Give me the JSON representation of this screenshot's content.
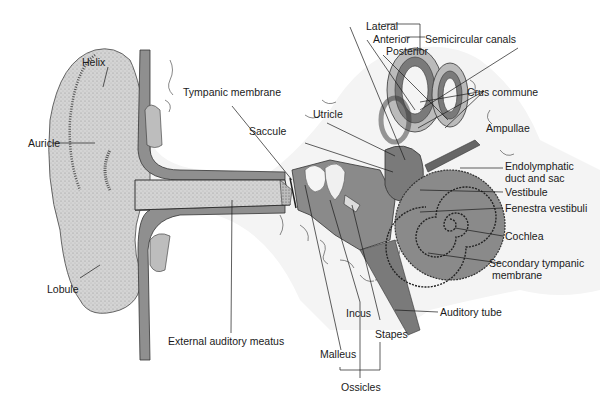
{
  "colors": {
    "background": "#ffffff",
    "skin_light": "#d9d9d9",
    "tissue_mid": "#a6a6a6",
    "tissue_dark": "#7a7a7a",
    "outline": "#333333",
    "bone": "#f2f2f2",
    "leader_line": "#1a1a1a"
  },
  "labels": {
    "lateral": "Lateral",
    "anterior": "Anterior",
    "posterior": "Posterior",
    "semicircular_canals": "Semicircular canals",
    "helix": "Helix",
    "tympanic_membrane": "Tympanic membrane",
    "crus_commune": "Crus commune",
    "utricle": "Utricle",
    "saccule": "Saccule",
    "ampullae": "Ampullae",
    "auricle": "Auricle",
    "endolymphatic_1": "Endolymphatic",
    "endolymphatic_2": "duct and sac",
    "vestibule": "Vestibule",
    "fenestra_vestibuli": "Fenestra vestibuli",
    "cochlea": "Cochlea",
    "secondary_tympanic_1": "Secondary tympanic",
    "secondary_tympanic_2": "membrane",
    "lobule": "Lobule",
    "auditory_tube": "Auditory tube",
    "incus": "Incus",
    "external_auditory_meatus": "External auditory meatus",
    "stapes": "Stapes",
    "malleus": "Malleus",
    "ossicles": "Ossicles"
  }
}
